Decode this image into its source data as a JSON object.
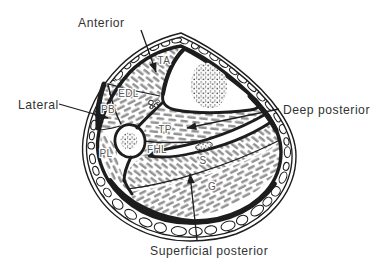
{
  "colors": {
    "background": "#ffffff",
    "ink": "#1d1d1d",
    "label_text": "#333333",
    "muscle_text": "#565656",
    "hatch": "#929292"
  },
  "compartment_labels": {
    "anterior": "Anterior",
    "lateral": "Lateral",
    "deep_posterior": "Deep posterior",
    "superficial_posterior": "Superficial posterior"
  },
  "muscle_labels": {
    "ta": "TA",
    "edl": "EDL",
    "pb": "PB",
    "pl": "PL",
    "tp": "TP",
    "fhl": "FHL",
    "s": "S",
    "g": "G"
  }
}
